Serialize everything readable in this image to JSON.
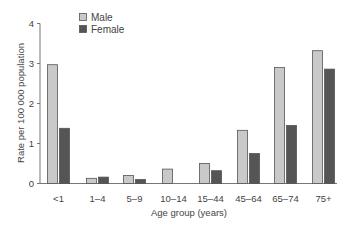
{
  "chart_data": {
    "type": "bar",
    "title": "",
    "xlabel": "Age group (years)",
    "ylabel": "Rate per 100 000 population",
    "ylim": [
      0,
      4
    ],
    "yticks": [
      0,
      1,
      2,
      3,
      4
    ],
    "grid": false,
    "legend_position": "top-left (inside plot)",
    "categories": [
      "<1",
      "1–4",
      "5–9",
      "10–14",
      "15–44",
      "45–64",
      "65–74",
      "75+"
    ],
    "series": [
      {
        "name": "Male",
        "color": "#c9c9c9",
        "values": [
          2.97,
          0.13,
          0.2,
          0.36,
          0.5,
          1.33,
          2.9,
          3.32
        ]
      },
      {
        "name": "Female",
        "color": "#555555",
        "values": [
          1.38,
          0.16,
          0.1,
          0.0,
          0.32,
          0.75,
          1.45,
          2.86
        ]
      }
    ]
  },
  "colors": {
    "axis": "#777777",
    "bar_outline": "#555555"
  }
}
